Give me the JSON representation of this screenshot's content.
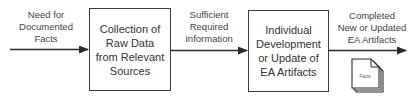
{
  "diagram": {
    "type": "process-flow",
    "input_label": "Need for\nDocumented\nFacts",
    "process_1": "Collection of\nRaw Data\nfrom Relevant\nSources",
    "intermediate_label": "Sufficient\nRequired\nInformation",
    "process_2": "Individual\nDevelopment\nor Update of\nEA Artifacts",
    "output_label": "Completed\nNew or Updated\nEA Artifacts",
    "document_icon_label": "Facts",
    "colors": {
      "stroke": "#3c3c3c",
      "text": "#444444",
      "background": "#ffffff"
    }
  }
}
